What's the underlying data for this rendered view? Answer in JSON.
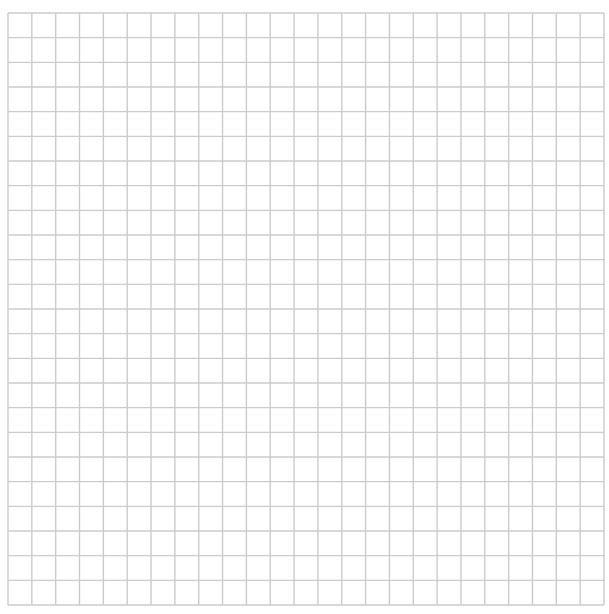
{
  "grid": {
    "left": 8,
    "top": 13,
    "right": 604,
    "bottom": 605,
    "columns": 25,
    "rows": 24,
    "line_color": "#cbcbcb",
    "line_width": 1.4,
    "background": "#ffffff"
  }
}
